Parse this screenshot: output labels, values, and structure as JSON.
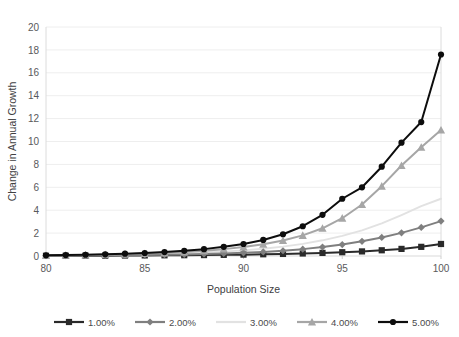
{
  "chart_data": {
    "type": "line",
    "title": "",
    "xlabel": "Population Size",
    "ylabel": "Change in Annual Growth",
    "xlim": [
      80,
      100
    ],
    "ylim": [
      0,
      20
    ],
    "x_ticks": [
      80,
      85,
      90,
      95,
      100
    ],
    "x_tick_labels": [
      "80",
      "85",
      "90",
      "95",
      "100"
    ],
    "y_ticks": [
      0,
      2,
      4,
      6,
      8,
      10,
      12,
      14,
      16,
      18,
      20
    ],
    "y_tick_labels": [
      "0",
      "2",
      "4",
      "6",
      "8",
      "10",
      "12",
      "14",
      "16",
      "18",
      "20"
    ],
    "grid": "horizontal",
    "legend_position": "bottom",
    "x": [
      80,
      81,
      82,
      83,
      84,
      85,
      86,
      87,
      88,
      89,
      90,
      91,
      92,
      93,
      94,
      95,
      96,
      97,
      98,
      99,
      100
    ],
    "series": [
      {
        "name": "1.00%",
        "color": "#2a2a2a",
        "marker": "square",
        "values": [
          0.02,
          0.02,
          0.03,
          0.03,
          0.04,
          0.05,
          0.06,
          0.07,
          0.08,
          0.1,
          0.12,
          0.15,
          0.18,
          0.22,
          0.27,
          0.33,
          0.4,
          0.5,
          0.62,
          0.8,
          1.05
        ]
      },
      {
        "name": "2.00%",
        "color": "#7f7f7f",
        "marker": "diamond",
        "values": [
          0.03,
          0.04,
          0.05,
          0.06,
          0.07,
          0.09,
          0.11,
          0.14,
          0.18,
          0.22,
          0.28,
          0.36,
          0.46,
          0.6,
          0.78,
          1.0,
          1.28,
          1.62,
          2.02,
          2.5,
          3.05
        ]
      },
      {
        "name": "3.00%",
        "color": "#e2e2e2",
        "marker": "none",
        "values": [
          0.04,
          0.05,
          0.07,
          0.09,
          0.11,
          0.14,
          0.18,
          0.23,
          0.3,
          0.38,
          0.49,
          0.63,
          0.82,
          1.06,
          1.37,
          1.76,
          2.24,
          2.85,
          3.58,
          4.35,
          5.0
        ]
      },
      {
        "name": "4.00%",
        "color": "#a6a6a6",
        "marker": "triangle",
        "values": [
          0.05,
          0.07,
          0.09,
          0.12,
          0.16,
          0.21,
          0.27,
          0.35,
          0.46,
          0.6,
          0.78,
          1.02,
          1.35,
          1.8,
          2.42,
          3.3,
          4.5,
          6.1,
          7.9,
          9.5,
          11.0
        ]
      },
      {
        "name": "5.00%",
        "color": "#0d0d0d",
        "marker": "circle",
        "values": [
          0.06,
          0.08,
          0.11,
          0.15,
          0.2,
          0.26,
          0.34,
          0.45,
          0.6,
          0.8,
          1.05,
          1.4,
          1.9,
          2.6,
          3.6,
          5.0,
          6.0,
          7.8,
          9.9,
          11.7,
          17.6
        ]
      }
    ]
  },
  "legend": {
    "items": [
      {
        "label": "1.00%"
      },
      {
        "label": "2.00%"
      },
      {
        "label": "3.00%"
      },
      {
        "label": "4.00%"
      },
      {
        "label": "5.00%"
      }
    ]
  }
}
